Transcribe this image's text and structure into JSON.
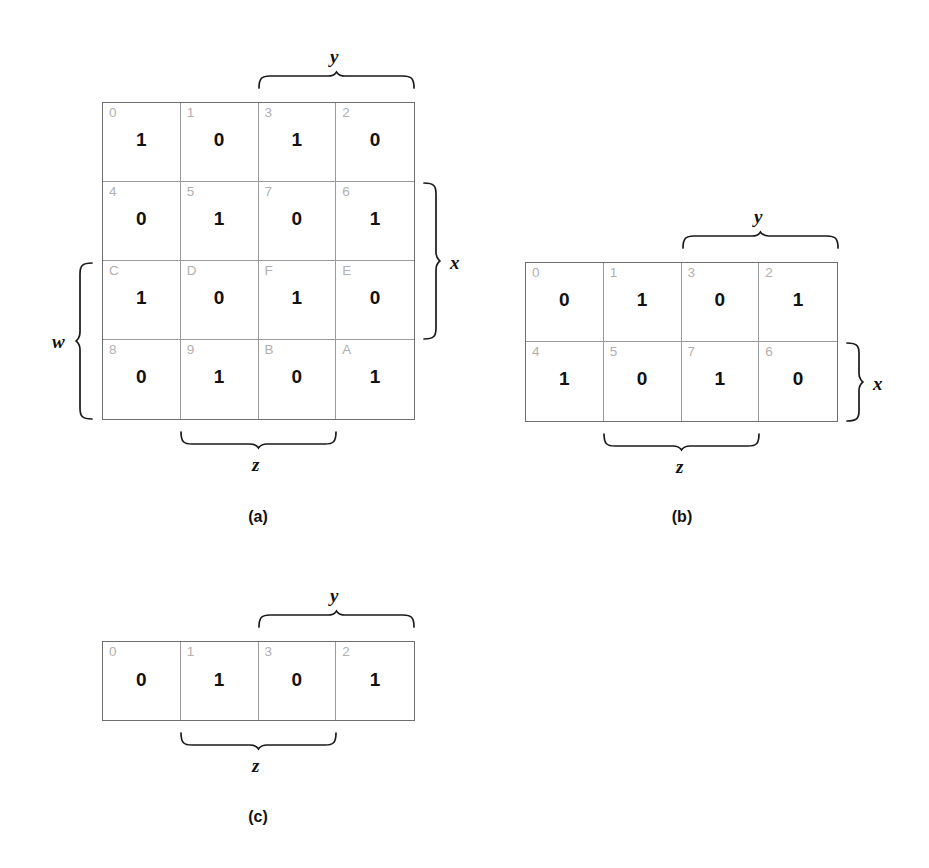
{
  "figure": {
    "type": "karnaugh-map-set",
    "background_color": "#ffffff",
    "index_color": "#b0b0b0",
    "value_color": "#111111",
    "grid_color": "#9a9a9a"
  },
  "maps": [
    {
      "id": "a",
      "caption": "(a)",
      "variables": [
        "w",
        "x",
        "y",
        "z"
      ],
      "columns": 4,
      "rows": 4,
      "cells": [
        {
          "index": "0",
          "value": "1"
        },
        {
          "index": "1",
          "value": "0"
        },
        {
          "index": "3",
          "value": "1"
        },
        {
          "index": "2",
          "value": "0"
        },
        {
          "index": "4",
          "value": "0"
        },
        {
          "index": "5",
          "value": "1"
        },
        {
          "index": "7",
          "value": "0"
        },
        {
          "index": "6",
          "value": "1"
        },
        {
          "index": "C",
          "value": "1"
        },
        {
          "index": "D",
          "value": "0"
        },
        {
          "index": "F",
          "value": "1"
        },
        {
          "index": "E",
          "value": "0"
        },
        {
          "index": "8",
          "value": "0"
        },
        {
          "index": "9",
          "value": "1"
        },
        {
          "index": "B",
          "value": "0"
        },
        {
          "index": "A",
          "value": "1"
        }
      ],
      "braces": {
        "top": {
          "label": "y",
          "spans_columns": [
            3,
            4
          ]
        },
        "bottom": {
          "label": "z",
          "spans_columns": [
            2,
            3
          ]
        },
        "right": {
          "label": "x",
          "spans_rows": [
            2,
            3
          ]
        },
        "left": {
          "label": "w",
          "spans_rows": [
            3,
            4
          ]
        }
      }
    },
    {
      "id": "b",
      "caption": "(b)",
      "variables": [
        "x",
        "y",
        "z"
      ],
      "columns": 4,
      "rows": 2,
      "cells": [
        {
          "index": "0",
          "value": "0"
        },
        {
          "index": "1",
          "value": "1"
        },
        {
          "index": "3",
          "value": "0"
        },
        {
          "index": "2",
          "value": "1"
        },
        {
          "index": "4",
          "value": "1"
        },
        {
          "index": "5",
          "value": "0"
        },
        {
          "index": "7",
          "value": "1"
        },
        {
          "index": "6",
          "value": "0"
        }
      ],
      "braces": {
        "top": {
          "label": "y",
          "spans_columns": [
            3,
            4
          ]
        },
        "bottom": {
          "label": "z",
          "spans_columns": [
            2,
            3
          ]
        },
        "right": {
          "label": "x",
          "spans_rows": [
            2,
            2
          ]
        }
      }
    },
    {
      "id": "c",
      "caption": "(c)",
      "variables": [
        "y",
        "z"
      ],
      "columns": 4,
      "rows": 1,
      "cells": [
        {
          "index": "0",
          "value": "0"
        },
        {
          "index": "1",
          "value": "1"
        },
        {
          "index": "3",
          "value": "0"
        },
        {
          "index": "2",
          "value": "1"
        }
      ],
      "braces": {
        "top": {
          "label": "y",
          "spans_columns": [
            3,
            4
          ]
        },
        "bottom": {
          "label": "z",
          "spans_columns": [
            2,
            3
          ]
        }
      }
    }
  ]
}
